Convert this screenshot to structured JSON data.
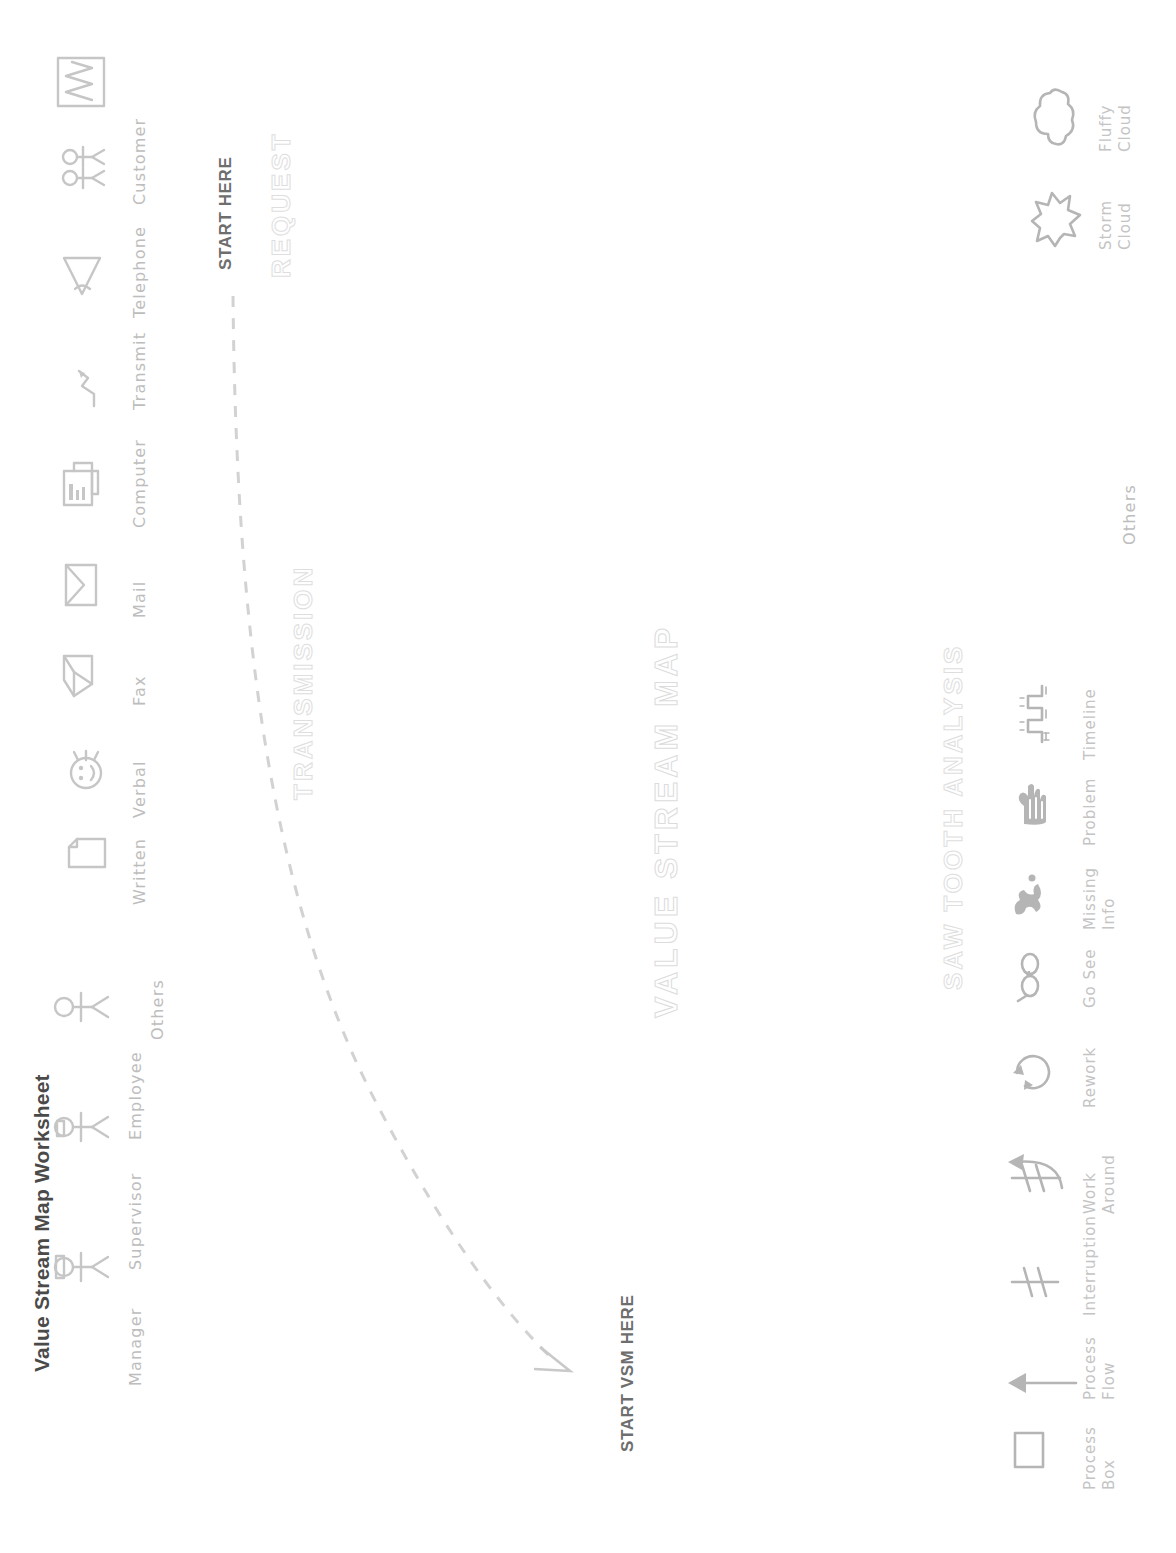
{
  "document": {
    "title": "Value Stream Map Worksheet",
    "background_color": "#ffffff",
    "ink_color": "#c6c6c6",
    "heading_color": "#4a4a4a",
    "orientation": "rotated-90-ccw"
  },
  "people_legend": {
    "items": [
      {
        "label": "Manager",
        "icon": "manager-stick-figure-icon"
      },
      {
        "label": "Supervisor",
        "icon": "supervisor-stick-figure-icon"
      },
      {
        "label": "Employee",
        "icon": "employee-stick-figure-icon"
      }
    ]
  },
  "transmission_section": {
    "heading": "TRANSMISSION",
    "others_label": "Others",
    "items": [
      {
        "label": "Written",
        "icon": "document-page-icon"
      },
      {
        "label": "Verbal",
        "icon": "speaking-face-icon"
      },
      {
        "label": "Fax",
        "icon": "fax-machine-icon"
      },
      {
        "label": "Mail",
        "icon": "envelope-icon"
      },
      {
        "label": "Computer",
        "icon": "computer-monitor-icon"
      },
      {
        "label": "Transmit",
        "icon": "lightning-transmit-icon"
      },
      {
        "label": "Telephone",
        "icon": "telephone-handset-icon"
      },
      {
        "label": "Customer",
        "icon": "customer-group-icon"
      }
    ]
  },
  "callouts": {
    "start_here": "START HERE",
    "request": "REQUEST",
    "start_vsm_here": "START VSM HERE"
  },
  "vsm_section": {
    "heading": "VALUE STREAM MAP"
  },
  "saw_tooth_section": {
    "heading": "SAW TOOTH ANALYSIS",
    "others_label": "Others",
    "items": [
      {
        "label": "Process\nBox",
        "line1": "Process",
        "line2": "Box",
        "icon": "process-box-icon"
      },
      {
        "label": "Process\nFlow",
        "line1": "Process",
        "line2": "Flow",
        "icon": "process-flow-arrow-icon"
      },
      {
        "label": "Interruption",
        "line1": "Interruption",
        "line2": "",
        "icon": "interruption-icon"
      },
      {
        "label": "Work\nAround",
        "line1": "Work",
        "line2": "Around",
        "icon": "work-around-icon"
      },
      {
        "label": "Rework",
        "line1": "Rework",
        "line2": "",
        "icon": "rework-cycle-icon"
      },
      {
        "label": "Go See",
        "line1": "Go See",
        "line2": "",
        "icon": "eyeglasses-go-see-icon"
      },
      {
        "label": "Missing\nInfo",
        "line1": "Missing",
        "line2": "Info",
        "icon": "missing-info-icon"
      },
      {
        "label": "Problem",
        "line1": "Problem",
        "line2": "",
        "icon": "pointing-hand-problem-icon"
      },
      {
        "label": "Timeline",
        "line1": "Timeline",
        "line2": "",
        "icon": "saw-tooth-timeline-icon"
      }
    ]
  },
  "clouds_legend": {
    "items": [
      {
        "line1": "Storm",
        "line2": "Cloud",
        "icon": "storm-cloud-icon"
      },
      {
        "line1": "Fluffy",
        "line2": "Cloud",
        "icon": "fluffy-cloud-icon"
      }
    ]
  }
}
